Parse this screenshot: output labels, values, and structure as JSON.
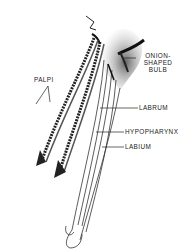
{
  "figure": {
    "labels": {
      "palpi": "PALPI",
      "bulb_line1": "ONION-",
      "bulb_line2": "SHAPED",
      "bulb_line3": "BULB",
      "labrum": "LABRUM",
      "hypopharynx": "HYPOPHARYNX",
      "labium": "LABIUM"
    },
    "colors": {
      "ink": "#222222",
      "background": "#ffffff"
    }
  }
}
